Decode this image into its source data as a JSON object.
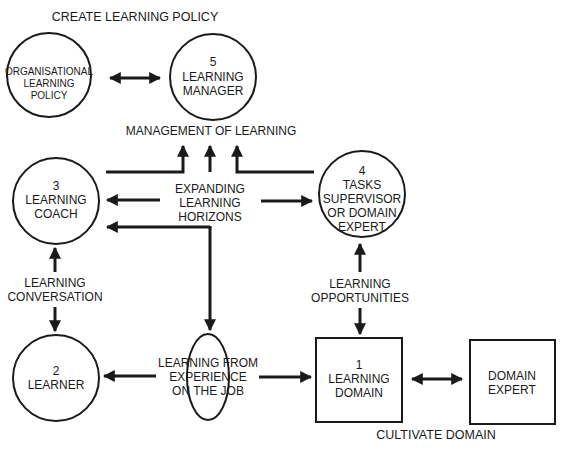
{
  "diagram": {
    "title_top": "CREATE LEARNING POLICY",
    "title_bottom": "CULTIVATE DOMAIN",
    "label_management": "MANAGEMENT OF LEARNING",
    "label_horizons": [
      "EXPANDING",
      "LEARNING",
      "HORIZONS"
    ],
    "label_conversation": [
      "LEARNING",
      "CONVERSATION"
    ],
    "label_opportunities": [
      "LEARNING",
      "OPPORTUNITIES"
    ],
    "label_experience": [
      "LEARNING FROM",
      "EXPERIENCE",
      "ON THE JOB"
    ],
    "nodes": {
      "org_policy": {
        "shape": "circle",
        "lines": [
          "ORGANISATIONAL",
          "LEARNING",
          "POLICY"
        ]
      },
      "manager": {
        "shape": "circle",
        "number": "5",
        "lines": [
          "LEARNING",
          "MANAGER"
        ]
      },
      "coach": {
        "shape": "circle",
        "number": "3",
        "lines": [
          "LEARNING",
          "COACH"
        ]
      },
      "supervisor": {
        "shape": "circle",
        "number": "4",
        "lines": [
          "TASKS",
          "SUPERVISOR",
          "OR DOMAIN",
          "EXPERT"
        ]
      },
      "learner": {
        "shape": "circle",
        "number": "2",
        "lines": [
          "LEARNER"
        ]
      },
      "domain": {
        "shape": "box",
        "number": "1",
        "lines": [
          "LEARNING",
          "DOMAIN"
        ]
      },
      "domain_expert": {
        "shape": "box",
        "lines": [
          "DOMAIN",
          "EXPERT"
        ]
      }
    },
    "colors": {
      "ink": "#1a1a1a",
      "background": "#ffffff"
    }
  }
}
